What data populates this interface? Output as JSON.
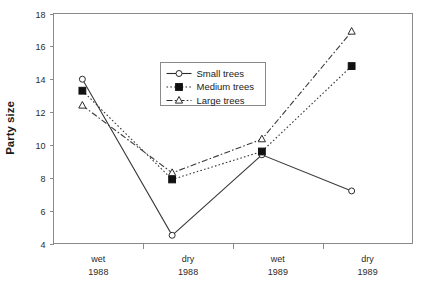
{
  "chart_data": {
    "type": "line",
    "title": "",
    "xlabel": "",
    "ylabel": "Party size",
    "ylim": [
      4,
      18
    ],
    "yticks": [
      4,
      6,
      8,
      10,
      12,
      14,
      16,
      18
    ],
    "grid": false,
    "legend_position": "inside-top-center",
    "categories": [
      "wet\n1988",
      "dry\n1988",
      "wet\n1989",
      "dry\n1989"
    ],
    "category_lines": [
      [
        "wet",
        "1988"
      ],
      [
        "dry",
        "1988"
      ],
      [
        "wet",
        "1989"
      ],
      [
        "dry",
        "1989"
      ]
    ],
    "series": [
      {
        "name": "Small trees",
        "values": [
          14.0,
          4.5,
          9.4,
          7.2
        ],
        "marker": "open-circle",
        "line_style": "solid",
        "color": "#2b2b2b"
      },
      {
        "name": "Medium trees",
        "values": [
          13.3,
          7.9,
          9.6,
          14.8
        ],
        "marker": "filled-square",
        "line_style": "dotted",
        "color": "#2b2b2b"
      },
      {
        "name": "Large trees",
        "values": [
          12.4,
          8.3,
          10.35,
          16.9
        ],
        "marker": "open-triangle",
        "line_style": "dash-dot",
        "color": "#2b2b2b"
      }
    ]
  },
  "axes": {
    "y_title": "Party size",
    "y_tick_labels": [
      "4",
      "6",
      "8",
      "10",
      "12",
      "14",
      "16",
      "18"
    ],
    "x_tick_labels_top": [
      "wet",
      "dry",
      "wet",
      "dry"
    ],
    "x_tick_labels_bottom": [
      "1988",
      "1988",
      "1989",
      "1989"
    ]
  },
  "legend": {
    "items": [
      {
        "label": "Small trees"
      },
      {
        "label": "Medium trees"
      },
      {
        "label": "Large trees"
      }
    ]
  },
  "colors": {
    "axis": "#8a8a8a",
    "text": "#1a1a1a",
    "line": "#2b2b2b",
    "marker_fill": "#111111",
    "background": "#ffffff"
  }
}
